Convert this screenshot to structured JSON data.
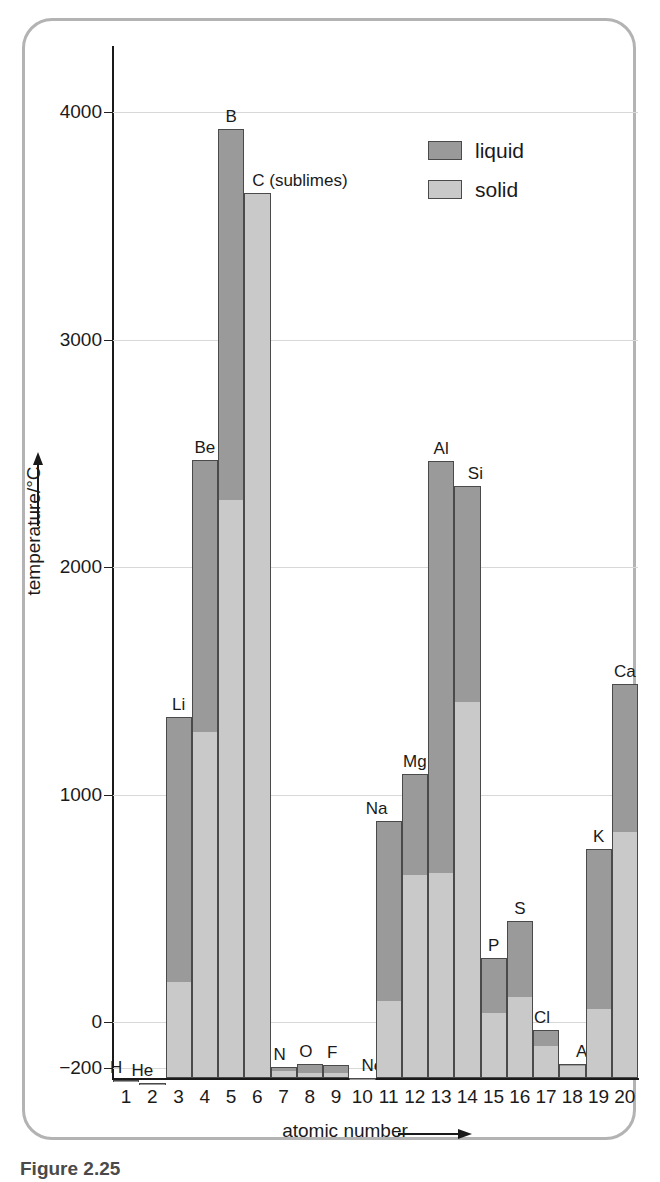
{
  "figure": {
    "caption_partial": "Figure 2.25",
    "border_color": "#b3b3b3"
  },
  "legend": {
    "position": "top-right",
    "items": [
      {
        "label": "liquid",
        "color": "#9a9a9a",
        "name": "liquid"
      },
      {
        "label": "solid",
        "color": "#c9c9c9",
        "name": "solid"
      }
    ]
  },
  "axes": {
    "y_title": "temperature/°C",
    "y_arrow": "up-arrow",
    "x_title": "atomic number",
    "x_arrow": "right-arrow",
    "y_ticks": [
      "4000",
      "3000",
      "2000",
      "1000",
      "0",
      "−200"
    ],
    "y_tick_values": [
      4000,
      3000,
      2000,
      1000,
      0,
      -200
    ],
    "x_ticks": [
      "1",
      "2",
      "3",
      "4",
      "5",
      "6",
      "7",
      "8",
      "9",
      "10",
      "11",
      "12",
      "13",
      "14",
      "15",
      "16",
      "17",
      "18",
      "19",
      "20"
    ]
  },
  "chart_data": {
    "type": "bar",
    "title": "",
    "subtitle": "",
    "xlabel": "atomic number",
    "ylabel": "temperature/°C",
    "ylim": [
      -270,
      4400
    ],
    "grid": true,
    "legend_position": "top-right",
    "stacked": true,
    "note": "Each column is a stacked bar: lower light-grey segment spans up to the melting point (solid range), upper dark-grey segment spans melting point to boiling point (liquid range).",
    "categories": [
      1,
      2,
      3,
      4,
      5,
      6,
      7,
      8,
      9,
      10,
      11,
      12,
      13,
      14,
      15,
      16,
      17,
      18,
      19,
      20
    ],
    "category_labels": [
      "H",
      "He",
      "Li",
      "Be",
      "B",
      "C (sublimes)",
      "N",
      "O",
      "F",
      "Ne",
      "Na",
      "Mg",
      "Al",
      "Si",
      "P",
      "S",
      "Cl",
      "Ar",
      "K",
      "Ca"
    ],
    "series": [
      {
        "name": "solid",
        "description": "melting point (top of light-grey segment)",
        "values": [
          -259,
          -272,
          180,
          1278,
          2300,
          3642,
          -210,
          -218,
          -220,
          -249,
          98,
          649,
          660,
          1410,
          44,
          113,
          -101,
          -189,
          63,
          839
        ]
      },
      {
        "name": "liquid",
        "description": "boiling point (top of dark-grey segment)",
        "values": [
          -253,
          -269,
          1342,
          2470,
          3927,
          3642,
          -196,
          -183,
          -188,
          -246,
          883,
          1090,
          2467,
          2355,
          280,
          445,
          -34,
          -186,
          760,
          1484
        ]
      }
    ],
    "bars": [
      {
        "z": 1,
        "symbol": "H",
        "melting": -259,
        "boiling": -253
      },
      {
        "z": 2,
        "symbol": "He",
        "melting": -272,
        "boiling": -269
      },
      {
        "z": 3,
        "symbol": "Li",
        "melting": 180,
        "boiling": 1342
      },
      {
        "z": 4,
        "symbol": "Be",
        "melting": 1278,
        "boiling": 2470
      },
      {
        "z": 5,
        "symbol": "B",
        "melting": 2300,
        "boiling": 3927
      },
      {
        "z": 6,
        "symbol": "C (sublimes)",
        "melting": 3642,
        "boiling": 3642
      },
      {
        "z": 7,
        "symbol": "N",
        "melting": -210,
        "boiling": -196
      },
      {
        "z": 8,
        "symbol": "O",
        "melting": -218,
        "boiling": -183
      },
      {
        "z": 9,
        "symbol": "F",
        "melting": -220,
        "boiling": -188
      },
      {
        "z": 10,
        "symbol": "Ne",
        "melting": -249,
        "boiling": -246
      },
      {
        "z": 11,
        "symbol": "Na",
        "melting": 98,
        "boiling": 883
      },
      {
        "z": 12,
        "symbol": "Mg",
        "melting": 649,
        "boiling": 1090
      },
      {
        "z": 13,
        "symbol": "Al",
        "melting": 660,
        "boiling": 2467
      },
      {
        "z": 14,
        "symbol": "Si",
        "melting": 1410,
        "boiling": 2355
      },
      {
        "z": 15,
        "symbol": "P",
        "melting": 44,
        "boiling": 280
      },
      {
        "z": 16,
        "symbol": "S",
        "melting": 113,
        "boiling": 445
      },
      {
        "z": 17,
        "symbol": "Cl",
        "melting": -101,
        "boiling": -34
      },
      {
        "z": 18,
        "symbol": "Ar",
        "melting": -189,
        "boiling": -186
      },
      {
        "z": 19,
        "symbol": "K",
        "melting": 63,
        "boiling": 760
      },
      {
        "z": 20,
        "symbol": "Ca",
        "melting": 839,
        "boiling": 1484
      }
    ]
  },
  "render": {
    "plot_left": 113,
    "plot_right": 638,
    "baseline_y": 1078,
    "zero_y": 1022,
    "px_per_1000": 227.5,
    "label_offsets": {
      "H": -10,
      "He": -10,
      "Li": 0,
      "Be": 0,
      "B": 0,
      "C (sublimes)": 38,
      "N": -4,
      "O": -4,
      "F": -4,
      "Ne": 10,
      "Na": -12,
      "Mg": 0,
      "Al": 0,
      "Si": 8,
      "P": 0,
      "S": 0,
      "Cl": -4,
      "Ar": 12,
      "K": 0,
      "Ca": 0
    }
  }
}
